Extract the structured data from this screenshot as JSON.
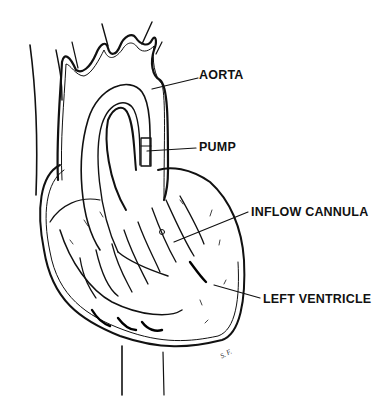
{
  "figure": {
    "labels": {
      "aorta": "AORTA",
      "pump": "PUMP",
      "inflow_cannula": "INFLOW CANNULA",
      "left_ventricle": "LEFT VENTRICLE"
    },
    "signature": "S. F."
  }
}
